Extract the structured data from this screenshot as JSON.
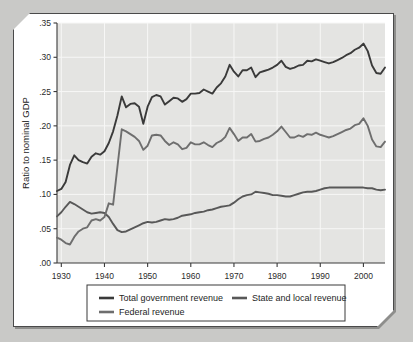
{
  "chart_data": {
    "type": "line",
    "title": "",
    "xlabel": "",
    "ylabel": "Ratio to nominal GDP",
    "xlim": [
      1929,
      2005
    ],
    "ylim": [
      0.0,
      0.35
    ],
    "xticks": [
      1930,
      1940,
      1950,
      1960,
      1970,
      1980,
      1990,
      2000
    ],
    "xtick_labels": [
      "1930",
      "1940",
      "1950",
      "1960",
      "1970",
      "1980",
      "1990",
      "2000"
    ],
    "yticks": [
      0.0,
      0.05,
      0.1,
      0.15,
      0.2,
      0.25,
      0.3,
      0.35
    ],
    "ytick_labels": [
      ".00",
      ".05",
      ".10",
      ".15",
      ".20",
      ".25",
      ".30",
      ".35"
    ],
    "grid": true,
    "legend_position": "below-axes",
    "x": [
      1929,
      1930,
      1931,
      1932,
      1933,
      1934,
      1935,
      1936,
      1937,
      1938,
      1939,
      1940,
      1941,
      1942,
      1943,
      1944,
      1945,
      1946,
      1947,
      1948,
      1949,
      1950,
      1951,
      1952,
      1953,
      1954,
      1955,
      1956,
      1957,
      1958,
      1959,
      1960,
      1961,
      1962,
      1963,
      1964,
      1965,
      1966,
      1967,
      1968,
      1969,
      1970,
      1971,
      1972,
      1973,
      1974,
      1975,
      1976,
      1977,
      1978,
      1979,
      1980,
      1981,
      1982,
      1983,
      1984,
      1985,
      1986,
      1987,
      1988,
      1989,
      1990,
      1991,
      1992,
      1993,
      1994,
      1995,
      1996,
      1997,
      1998,
      1999,
      2000,
      2001,
      2002,
      2003,
      2004,
      2005
    ],
    "series": [
      {
        "name": "Total government revenue",
        "color": "#3a3a3a",
        "values": [
          0.105,
          0.108,
          0.118,
          0.143,
          0.157,
          0.15,
          0.147,
          0.145,
          0.155,
          0.16,
          0.158,
          0.163,
          0.175,
          0.192,
          0.215,
          0.243,
          0.227,
          0.232,
          0.233,
          0.228,
          0.203,
          0.228,
          0.242,
          0.245,
          0.243,
          0.231,
          0.236,
          0.241,
          0.24,
          0.235,
          0.239,
          0.247,
          0.247,
          0.248,
          0.253,
          0.25,
          0.247,
          0.256,
          0.262,
          0.272,
          0.289,
          0.279,
          0.272,
          0.281,
          0.281,
          0.285,
          0.271,
          0.278,
          0.28,
          0.282,
          0.285,
          0.289,
          0.295,
          0.286,
          0.283,
          0.285,
          0.288,
          0.289,
          0.295,
          0.294,
          0.297,
          0.295,
          0.293,
          0.291,
          0.293,
          0.296,
          0.299,
          0.303,
          0.306,
          0.311,
          0.314,
          0.32,
          0.309,
          0.288,
          0.277,
          0.276,
          0.285
        ]
      },
      {
        "name": "State and local revenue",
        "color": "#585858",
        "values": [
          0.068,
          0.074,
          0.082,
          0.089,
          0.086,
          0.082,
          0.078,
          0.074,
          0.072,
          0.073,
          0.074,
          0.073,
          0.067,
          0.057,
          0.048,
          0.045,
          0.046,
          0.049,
          0.052,
          0.055,
          0.058,
          0.06,
          0.059,
          0.06,
          0.062,
          0.064,
          0.063,
          0.064,
          0.066,
          0.069,
          0.07,
          0.071,
          0.073,
          0.074,
          0.075,
          0.077,
          0.078,
          0.08,
          0.082,
          0.083,
          0.084,
          0.088,
          0.093,
          0.097,
          0.099,
          0.1,
          0.104,
          0.103,
          0.102,
          0.101,
          0.099,
          0.099,
          0.098,
          0.097,
          0.097,
          0.099,
          0.101,
          0.103,
          0.104,
          0.104,
          0.105,
          0.107,
          0.109,
          0.11,
          0.11,
          0.11,
          0.11,
          0.11,
          0.11,
          0.11,
          0.11,
          0.11,
          0.109,
          0.109,
          0.107,
          0.106,
          0.107
        ]
      },
      {
        "name": "Federal revenue",
        "color": "#6e6e6e",
        "values": [
          0.037,
          0.034,
          0.029,
          0.027,
          0.038,
          0.046,
          0.05,
          0.052,
          0.062,
          0.064,
          0.062,
          0.067,
          0.087,
          0.085,
          0.14,
          0.195,
          0.192,
          0.188,
          0.184,
          0.178,
          0.165,
          0.171,
          0.186,
          0.187,
          0.186,
          0.178,
          0.172,
          0.176,
          0.173,
          0.166,
          0.168,
          0.176,
          0.173,
          0.173,
          0.176,
          0.172,
          0.169,
          0.175,
          0.178,
          0.184,
          0.197,
          0.188,
          0.178,
          0.183,
          0.183,
          0.188,
          0.177,
          0.178,
          0.181,
          0.183,
          0.187,
          0.192,
          0.199,
          0.191,
          0.183,
          0.183,
          0.186,
          0.184,
          0.188,
          0.187,
          0.19,
          0.187,
          0.185,
          0.183,
          0.185,
          0.188,
          0.191,
          0.194,
          0.196,
          0.201,
          0.203,
          0.211,
          0.2,
          0.18,
          0.17,
          0.169,
          0.177
        ]
      }
    ]
  },
  "yaxis": {
    "label": "Ratio to nominal GDP"
  },
  "legend": {
    "items": [
      {
        "label": "Total government revenue",
        "color": "#3a3a3a"
      },
      {
        "label": "State and local revenue",
        "color": "#585858"
      },
      {
        "label": "Federal revenue",
        "color": "#6e6e6e"
      }
    ]
  }
}
